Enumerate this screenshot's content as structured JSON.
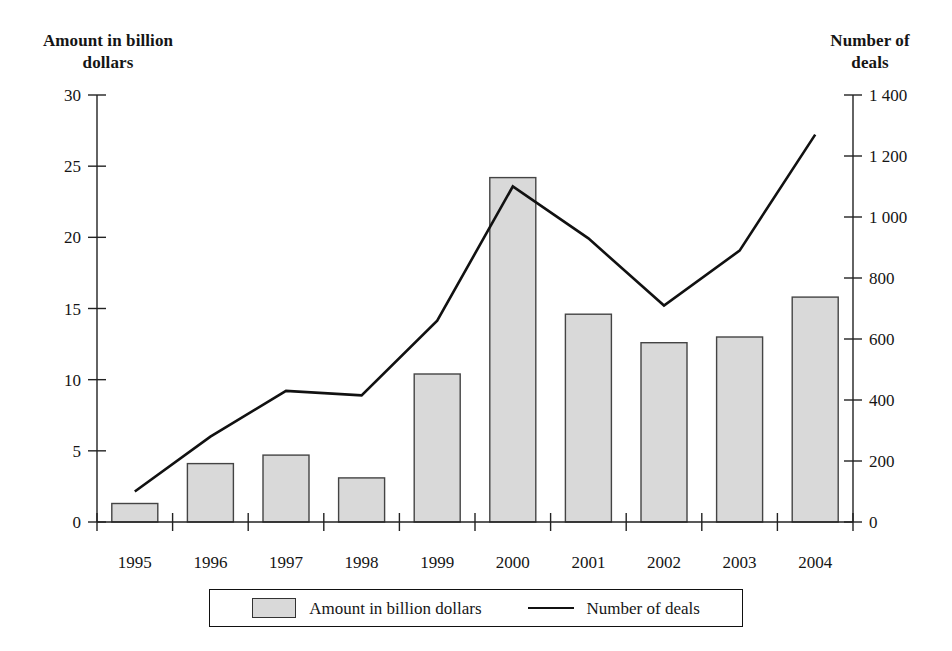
{
  "chart_data": {
    "type": "bar",
    "title": "",
    "subtitle": "",
    "categories": [
      "1995",
      "1996",
      "1997",
      "1998",
      "1999",
      "2000",
      "2001",
      "2002",
      "2003",
      "2004"
    ],
    "xlabel": "",
    "series": [
      {
        "name": "Amount in billion dollars",
        "type": "bar",
        "axis": "left",
        "color": "#d9d9d9",
        "edge_color": "#444444",
        "values": [
          1.3,
          4.1,
          4.7,
          3.1,
          10.4,
          24.2,
          14.6,
          12.6,
          13.0,
          15.8
        ]
      },
      {
        "name": "Number of deals",
        "type": "line",
        "axis": "right",
        "color": "#111111",
        "values": [
          100,
          280,
          430,
          415,
          660,
          1100,
          930,
          710,
          890,
          1270
        ]
      }
    ],
    "left_axis": {
      "label": "Amount in billion\ndollars",
      "ticks": [
        0,
        5,
        10,
        15,
        20,
        25,
        30
      ],
      "tick_labels": [
        "0",
        "5",
        "10",
        "15",
        "20",
        "25",
        "30"
      ],
      "ylim": [
        0,
        30
      ]
    },
    "right_axis": {
      "label": "Number of\ndeals",
      "ticks": [
        0,
        200,
        400,
        600,
        800,
        1000,
        1200,
        1400
      ],
      "tick_labels": [
        "0",
        "200",
        "400",
        "600",
        "800",
        "1 000",
        "1 200",
        "1 400"
      ],
      "ylim": [
        0,
        1400
      ]
    },
    "grid": false,
    "legend": {
      "position": "bottom",
      "entries": [
        {
          "label": "Amount in billion dollars",
          "marker": "square-swatch"
        },
        {
          "label": "Number of deals",
          "marker": "line"
        }
      ]
    }
  },
  "left_axis_title": "Amount in billion\ndollars",
  "right_axis_title": "Number of\ndeals"
}
